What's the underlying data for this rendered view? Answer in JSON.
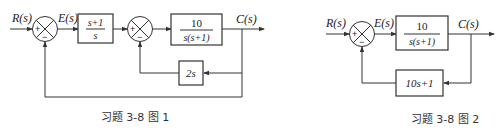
{
  "figure1": {
    "caption": "习题 3-8 图 1",
    "input_label": "R(s)",
    "error_label": "E(s)",
    "output_label": "C(s)",
    "sum1": {
      "plus": "+",
      "minus": "−"
    },
    "sum2": {
      "plus": "+",
      "minus": "−"
    },
    "block1": {
      "numerator": "s+1",
      "denominator": "s"
    },
    "block2": {
      "numerator": "10",
      "denominator": "s(s+1)"
    },
    "feedback_block": {
      "label": "2s"
    }
  },
  "figure2": {
    "caption": "习题 3-8 图 2",
    "input_label": "R(s)",
    "error_label": "E(s)",
    "output_label": "C(s)",
    "sum1": {
      "plus": "+",
      "minus": "−"
    },
    "forward_block": {
      "numerator": "10",
      "denominator": "s(s+1)"
    },
    "feedback_block": {
      "label": "10s+1"
    }
  }
}
